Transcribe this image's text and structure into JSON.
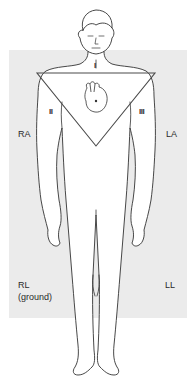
{
  "diagram": {
    "colors": {
      "background": "#ffffff",
      "panel": "#ebebeb",
      "outline": "#333333",
      "triangle": "#4a4a4a"
    },
    "leads": [
      {
        "id": "I",
        "label": "I"
      },
      {
        "id": "II",
        "label": "II"
      },
      {
        "id": "III",
        "label": "III"
      }
    ],
    "electrodes": {
      "ra": {
        "label": "RA"
      },
      "la": {
        "label": "LA"
      },
      "rl": {
        "label": "RL",
        "sublabel": "(ground)"
      },
      "ll": {
        "label": "LL"
      }
    },
    "heart_icon": "heart-anatomical-icon"
  }
}
